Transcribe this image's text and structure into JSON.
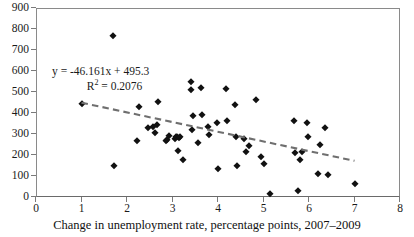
{
  "chart_data": {
    "type": "scatter",
    "title": "",
    "xlabel": "Change in unemployment rate, percentage points, 2007–2009",
    "ylabel": "",
    "xlim": [
      0,
      8
    ],
    "ylim": [
      0,
      900
    ],
    "xticks": [
      0,
      1,
      2,
      3,
      4,
      5,
      6,
      7,
      8
    ],
    "yticks": [
      0,
      100,
      200,
      300,
      400,
      500,
      600,
      700,
      800,
      900
    ],
    "grid": false,
    "legend": "none",
    "marker_shape": "diamond",
    "marker_color": "#111111",
    "points": [
      {
        "x": 1.0,
        "y": 441
      },
      {
        "x": 1.7,
        "y": 765
      },
      {
        "x": 1.72,
        "y": 147
      },
      {
        "x": 2.22,
        "y": 265
      },
      {
        "x": 2.27,
        "y": 427
      },
      {
        "x": 2.47,
        "y": 327
      },
      {
        "x": 2.57,
        "y": 332
      },
      {
        "x": 2.62,
        "y": 303
      },
      {
        "x": 2.65,
        "y": 342
      },
      {
        "x": 2.68,
        "y": 452
      },
      {
        "x": 2.85,
        "y": 265
      },
      {
        "x": 2.88,
        "y": 272
      },
      {
        "x": 2.92,
        "y": 290
      },
      {
        "x": 3.05,
        "y": 278
      },
      {
        "x": 3.08,
        "y": 286
      },
      {
        "x": 3.1,
        "y": 284
      },
      {
        "x": 3.12,
        "y": 218
      },
      {
        "x": 3.14,
        "y": 281
      },
      {
        "x": 3.16,
        "y": 288
      },
      {
        "x": 3.22,
        "y": 178
      },
      {
        "x": 3.4,
        "y": 549
      },
      {
        "x": 3.4,
        "y": 511
      },
      {
        "x": 3.42,
        "y": 319
      },
      {
        "x": 3.44,
        "y": 388
      },
      {
        "x": 3.55,
        "y": 259
      },
      {
        "x": 3.62,
        "y": 520
      },
      {
        "x": 3.64,
        "y": 392
      },
      {
        "x": 3.78,
        "y": 334
      },
      {
        "x": 3.8,
        "y": 297
      },
      {
        "x": 3.98,
        "y": 353
      },
      {
        "x": 4.0,
        "y": 134
      },
      {
        "x": 4.18,
        "y": 516
      },
      {
        "x": 4.2,
        "y": 362
      },
      {
        "x": 4.38,
        "y": 440
      },
      {
        "x": 4.4,
        "y": 288
      },
      {
        "x": 4.42,
        "y": 150
      },
      {
        "x": 4.58,
        "y": 274
      },
      {
        "x": 4.62,
        "y": 212
      },
      {
        "x": 4.68,
        "y": 244
      },
      {
        "x": 4.84,
        "y": 464
      },
      {
        "x": 4.95,
        "y": 190
      },
      {
        "x": 5.0,
        "y": 157
      },
      {
        "x": 5.15,
        "y": 15
      },
      {
        "x": 5.68,
        "y": 362
      },
      {
        "x": 5.7,
        "y": 208
      },
      {
        "x": 5.75,
        "y": 30
      },
      {
        "x": 5.8,
        "y": 174
      },
      {
        "x": 5.85,
        "y": 215
      },
      {
        "x": 5.95,
        "y": 351
      },
      {
        "x": 5.98,
        "y": 288
      },
      {
        "x": 6.2,
        "y": 108
      },
      {
        "x": 6.25,
        "y": 250
      },
      {
        "x": 6.35,
        "y": 329
      },
      {
        "x": 6.42,
        "y": 103
      },
      {
        "x": 7.0,
        "y": 60
      }
    ],
    "trendline": {
      "style": "dashed",
      "color": "#6f6f6f",
      "x_start": 1.0,
      "y_start": 449.1,
      "x_end": 7.0,
      "y_end": 172.2,
      "equation": "y = -46.161x + 495.3",
      "r_squared_label": "R",
      "r_squared_sup": "2",
      "r_squared_value": "= 0.2076",
      "slope": -46.161,
      "intercept": 495.3,
      "r_squared": 0.2076
    },
    "annotations": [
      {
        "name": "regression-equation",
        "text": "y = -46.161x + 495.3"
      },
      {
        "name": "r-squared",
        "text": "R² = 0.2076"
      }
    ]
  }
}
